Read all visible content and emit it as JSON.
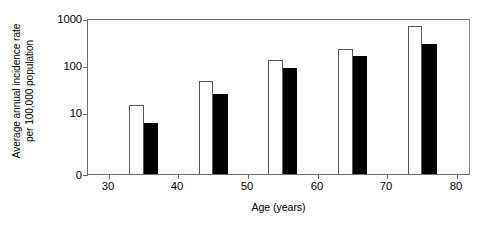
{
  "chart_data": {
    "type": "bar",
    "title": "",
    "xlabel": "Age (years)",
    "ylabel": "Average annual incidence rate per 100,000 population",
    "ylabel_line1": "Average annual incidence rate",
    "ylabel_line2": "per 100,000 population",
    "yscale": "log",
    "ylim": [
      1,
      1000
    ],
    "y_axis_break_at_zero": true,
    "ytick_labels": [
      "1000",
      "100",
      "10",
      "0"
    ],
    "ytick_values": [
      1000,
      100,
      10,
      0
    ],
    "xlim": [
      27,
      82
    ],
    "xtick_labels": [
      "30",
      "40",
      "50",
      "60",
      "70",
      "80"
    ],
    "xtick_values": [
      30,
      40,
      50,
      60,
      70,
      80
    ],
    "grid": false,
    "legend": "none",
    "categories": [
      "35",
      "45",
      "55",
      "65",
      "75"
    ],
    "x": [
      35,
      45,
      55,
      65,
      75
    ],
    "series": [
      {
        "name": "open",
        "fill": "#ffffff",
        "values": [
          15,
          47,
          135,
          230,
          700
        ]
      },
      {
        "name": "filled",
        "fill": "#000000",
        "values": [
          6,
          25,
          90,
          160,
          300
        ]
      }
    ]
  },
  "axes": {
    "yticks": [
      {
        "label": "1000",
        "value": 1000
      },
      {
        "label": "100",
        "value": 100
      },
      {
        "label": "10",
        "value": 10
      },
      {
        "label": "0",
        "value": 0
      }
    ],
    "xticks": [
      {
        "label": "30",
        "value": 30
      },
      {
        "label": "40",
        "value": 40
      },
      {
        "label": "50",
        "value": 50
      },
      {
        "label": "60",
        "value": 60
      },
      {
        "label": "70",
        "value": 70
      },
      {
        "label": "80",
        "value": 80
      }
    ]
  },
  "colors": {
    "open_bar_fill": "#ffffff",
    "open_bar_stroke": "#5a5a5a",
    "filled_bar_fill": "#000000",
    "axis": "#6f6f6f",
    "background": "#ffffff",
    "text": "#000000"
  }
}
